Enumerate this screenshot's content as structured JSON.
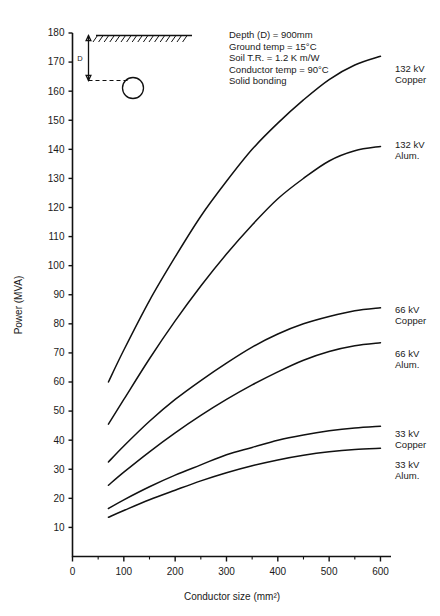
{
  "chart_data": {
    "type": "line",
    "title": "",
    "xlabel": "Conductor size (mm²)",
    "ylabel": "Power (MVA)",
    "xlim": [
      0,
      600
    ],
    "ylim": [
      0,
      180
    ],
    "grid": false,
    "legend_position": "right-inline-labels",
    "x_ticks": [
      0,
      100,
      200,
      300,
      400,
      500,
      600
    ],
    "x_tick_labels": [
      "0",
      "100",
      "200",
      "300",
      "400",
      "500",
      "600"
    ],
    "x_minor_ticks": [
      50,
      150,
      250,
      350,
      450,
      550
    ],
    "y_ticks": [
      10,
      20,
      30,
      40,
      50,
      60,
      70,
      80,
      90,
      100,
      110,
      120,
      130,
      140,
      150,
      160,
      170,
      180
    ],
    "y_tick_labels": [
      "10",
      "20",
      "30",
      "40",
      "50",
      "60",
      "70",
      "80",
      "90",
      "100",
      "110",
      "120",
      "130",
      "140",
      "150",
      "160",
      "170",
      "180"
    ],
    "series": [
      {
        "name": "132 kV Copper",
        "label_line1": "132 kV",
        "label_line2": "Copper",
        "x": [
          70,
          100,
          150,
          200,
          250,
          300,
          350,
          400,
          450,
          500,
          550,
          600
        ],
        "values": [
          60,
          71,
          88,
          103,
          117,
          129,
          140,
          149,
          157,
          164,
          169,
          172
        ]
      },
      {
        "name": "132 kV Alum.",
        "label_line1": "132 kV",
        "label_line2": "Alum.",
        "x": [
          70,
          100,
          150,
          200,
          250,
          300,
          350,
          400,
          450,
          500,
          550,
          600
        ],
        "values": [
          45.5,
          54,
          68,
          81,
          93,
          104,
          114,
          123,
          130,
          136,
          139.5,
          141
        ]
      },
      {
        "name": "66 kV Copper",
        "label_line1": "66 kV",
        "label_line2": "Copper",
        "x": [
          70,
          100,
          150,
          200,
          250,
          300,
          350,
          400,
          450,
          500,
          550,
          600
        ],
        "values": [
          32.5,
          38,
          46.5,
          54,
          60.5,
          66.5,
          72,
          76.5,
          80,
          82.5,
          84.5,
          85.5
        ]
      },
      {
        "name": "66 kV Alum.",
        "label_line1": "66 kV",
        "label_line2": "Alum.",
        "x": [
          70,
          100,
          150,
          200,
          250,
          300,
          350,
          400,
          450,
          500,
          550,
          600
        ],
        "values": [
          24.5,
          29,
          36,
          42.5,
          48.5,
          54,
          59,
          63.5,
          67.5,
          70.5,
          72.5,
          73.5
        ]
      },
      {
        "name": "33 kV Copper",
        "label_line1": "33 kV",
        "label_line2": "Copper",
        "x": [
          70,
          100,
          150,
          200,
          250,
          300,
          350,
          400,
          450,
          500,
          550,
          600
        ],
        "values": [
          16.5,
          19.5,
          24,
          28,
          31.5,
          35,
          37.5,
          40,
          41.8,
          43.2,
          44.2,
          44.8
        ]
      },
      {
        "name": "33 kV Alum.",
        "label_line1": "33 kV",
        "label_line2": "Alum.",
        "x": [
          70,
          100,
          150,
          200,
          250,
          300,
          350,
          400,
          450,
          500,
          550,
          600
        ],
        "values": [
          13.5,
          15.8,
          19.5,
          22.8,
          26,
          28.8,
          31.2,
          33.2,
          34.8,
          36,
          36.8,
          37.2
        ]
      }
    ],
    "annotations": [
      "Depth (D)  =  900mm",
      "Ground temp  =  15°C",
      "Soil T.R.  =  1.2  K m/W",
      "Conductor temp  =  90°C",
      "Solid bonding"
    ],
    "inset_diagram": {
      "depth_label": "D",
      "description": "buried cable depth diagram"
    }
  },
  "colors": {
    "curve": "#111111",
    "axis": "#111111",
    "text": "#1a1a1a",
    "background": "#ffffff"
  }
}
